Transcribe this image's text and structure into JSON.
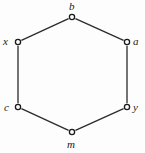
{
  "figure": {
    "type": "undirected-graph",
    "shape": "hexagon-cycle",
    "background_color": "#fdfdfd",
    "width": 145,
    "height": 153
  },
  "style": {
    "edge_color": "#2b2b2b",
    "edge_width": 1.3,
    "vertex_stroke_color": "#1a1a1a",
    "vertex_fill_color": "#ffffff",
    "vertex_radius": 2.6,
    "vertex_stroke_width": 1.3,
    "label_color": "#1a1a1a"
  },
  "graph": {
    "vertices": [
      {
        "id": "b",
        "label": "b",
        "cx": 72,
        "cy": 17,
        "label_x": 69,
        "label_y": 1
      },
      {
        "id": "a",
        "label": "a",
        "cx": 127,
        "cy": 42,
        "label_x": 133,
        "label_y": 36
      },
      {
        "id": "y",
        "label": "y",
        "cx": 127,
        "cy": 107,
        "label_x": 133,
        "label_y": 102
      },
      {
        "id": "m",
        "label": "m",
        "cx": 72,
        "cy": 132,
        "label_x": 67,
        "label_y": 139
      },
      {
        "id": "c",
        "label": "c",
        "cx": 18,
        "cy": 107,
        "label_x": 4,
        "label_y": 102
      },
      {
        "id": "x",
        "label": "x",
        "cx": 18,
        "cy": 42,
        "label_x": 3,
        "label_y": 36
      }
    ],
    "edges": [
      {
        "from": "x",
        "to": "b"
      },
      {
        "from": "b",
        "to": "a"
      },
      {
        "from": "a",
        "to": "y"
      },
      {
        "from": "y",
        "to": "m"
      },
      {
        "from": "m",
        "to": "c"
      },
      {
        "from": "c",
        "to": "x"
      }
    ]
  }
}
